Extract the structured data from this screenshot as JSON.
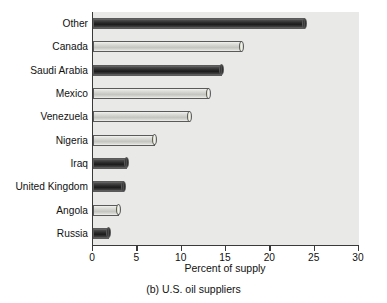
{
  "chart_data": {
    "type": "bar",
    "orientation": "horizontal",
    "title": "",
    "caption": "(b) U.S. oil suppliers",
    "xlabel": "Percent of supply",
    "ylabel": "",
    "xlim": [
      0,
      30
    ],
    "xticks": [
      0,
      5,
      10,
      15,
      20,
      25,
      30
    ],
    "xtick_labels": [
      "0",
      "5",
      "10",
      "15",
      "20",
      "25",
      "30"
    ],
    "grid": false,
    "legend": null,
    "categories": [
      "Other",
      "Canada",
      "Saudi Arabia",
      "Mexico",
      "Venezuela",
      "Nigeria",
      "Iraq",
      "United Kingdom",
      "Angola",
      "Russia"
    ],
    "values": [
      24.1,
      17.0,
      14.8,
      13.3,
      11.2,
      7.2,
      4.1,
      3.7,
      3.2,
      2.0
    ],
    "bar_styles": [
      "dark",
      "light",
      "dark",
      "light",
      "light",
      "light",
      "dark",
      "dark",
      "light",
      "dark"
    ],
    "colors": {
      "plot_background": "#e9e9e7",
      "axis": "#3a3a3a",
      "bar_dark": "#2a2a2a",
      "bar_light": "#cfcfcb",
      "text": "#111111",
      "page_background": "#ffffff"
    }
  }
}
